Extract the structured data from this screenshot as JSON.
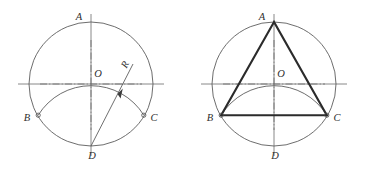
{
  "sheet": {
    "title": "Construction of an inscribed equilateral triangle",
    "background_color": "#ffffff",
    "outline_color": "#5c5c5c",
    "centerline_color": "#6a6a6a",
    "triangle_color": "#2b2b2b",
    "label_color": "#2e2e2e"
  },
  "panels": [
    {
      "id": "left",
      "caption": "Step 1 — strike arc of radius R from D",
      "labels": {
        "top": "A",
        "center": "O",
        "left": "B",
        "right": "C",
        "bottom": "D",
        "radius": "R"
      }
    },
    {
      "id": "right",
      "caption": "Step 2 — join A, B, C",
      "labels": {
        "top": "A",
        "center": "O",
        "left": "B",
        "right": "C",
        "bottom": "D"
      }
    }
  ],
  "geometry": {
    "circle": {
      "cx": 91,
      "cy": 84,
      "r": 62
    },
    "points": {
      "A": {
        "x": 91,
        "y": 22
      },
      "B": {
        "x": 38.2,
        "y": 115.2
      },
      "C": {
        "x": 143.8,
        "y": 115.2
      },
      "D": {
        "x": 91,
        "y": 146
      },
      "O": {
        "x": 91,
        "y": 84
      }
    },
    "arc_radius": 62,
    "radius_annotation": {
      "from": "D",
      "to_angle_deg": 52
    }
  }
}
